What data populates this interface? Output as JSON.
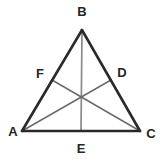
{
  "figure": {
    "type": "geometry-diagram",
    "canvas": {
      "width": 162,
      "height": 163,
      "background": "#ffffff"
    },
    "colors": {
      "side_stroke": "#2a2a2a",
      "median_stroke": "#6b6b6b",
      "median_vertical_stroke": "#8a8a8a",
      "label_text": "#262626"
    },
    "points": [
      {
        "id": "A",
        "label": "A",
        "role": "vertex",
        "x": 22,
        "y": 131,
        "label_x": 13,
        "label_y": 131
      },
      {
        "id": "B",
        "label": "B",
        "role": "vertex",
        "x": 82,
        "y": 30,
        "label_x": 82,
        "label_y": 11
      },
      {
        "id": "C",
        "label": "C",
        "role": "vertex",
        "x": 140,
        "y": 131,
        "label_x": 151,
        "label_y": 133
      },
      {
        "id": "D",
        "label": "D",
        "role": "midpoint-of-BC",
        "x": 111,
        "y": 80,
        "label_x": 122,
        "label_y": 72
      },
      {
        "id": "E",
        "label": "E",
        "role": "midpoint-of-AC",
        "x": 81,
        "y": 131,
        "label_x": 81,
        "label_y": 148
      },
      {
        "id": "F",
        "label": "F",
        "role": "midpoint-of-AB",
        "x": 52,
        "y": 80,
        "label_x": 40,
        "label_y": 73
      }
    ],
    "centroid": {
      "x": 81,
      "y": 97
    },
    "sides": [
      {
        "id": "AB",
        "from": "A",
        "to": "B",
        "x1": 22,
        "y1": 131,
        "x2": 82,
        "y2": 30,
        "width": 2.6
      },
      {
        "id": "BC",
        "from": "B",
        "to": "C",
        "x1": 82,
        "y1": 30,
        "x2": 140,
        "y2": 131,
        "width": 2.6
      },
      {
        "id": "AC",
        "from": "A",
        "to": "C",
        "x1": 22,
        "y1": 131,
        "x2": 140,
        "y2": 131,
        "width": 2.6
      }
    ],
    "medians": [
      {
        "id": "BE",
        "from": "B",
        "to": "E",
        "x1": 82,
        "y1": 30,
        "x2": 81,
        "y2": 131,
        "width": 1.7,
        "color": "#8a8a8a"
      },
      {
        "id": "AD",
        "from": "A",
        "to": "D",
        "x1": 22,
        "y1": 131,
        "x2": 111,
        "y2": 80,
        "width": 1.5,
        "color": "#6b6b6b"
      },
      {
        "id": "CF",
        "from": "C",
        "to": "F",
        "x1": 140,
        "y1": 131,
        "x2": 52,
        "y2": 80,
        "width": 1.5,
        "color": "#6b6b6b"
      }
    ]
  }
}
